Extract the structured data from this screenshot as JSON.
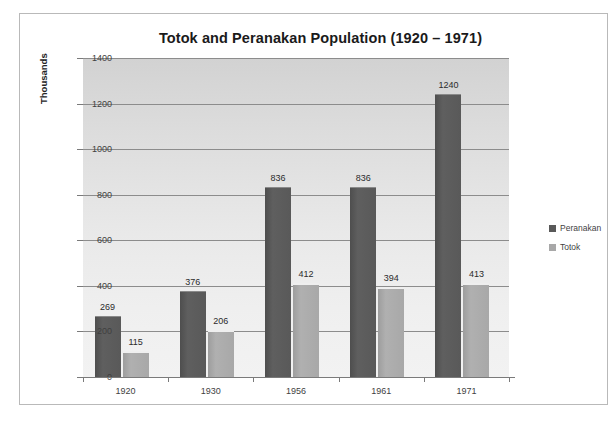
{
  "chart_data": {
    "type": "bar",
    "title": "Totok and Peranakan Population (1920 – 1971)",
    "xlabel": "",
    "ylabel": "Thousands",
    "ylim": [
      0,
      1400
    ],
    "ytick_step": 200,
    "yticks": [
      "0",
      "200",
      "400",
      "600",
      "800",
      "1000",
      "1200",
      "1400"
    ],
    "grid": true,
    "legend_position": "right",
    "categories": [
      "1920",
      "1930",
      "1956",
      "1961",
      "1971"
    ],
    "series": [
      {
        "name": "Peranakan",
        "color": "#595959",
        "values": [
          269,
          376,
          836,
          836,
          1240
        ]
      },
      {
        "name": "Totok",
        "color": "#a8a8a8",
        "values": [
          115,
          206,
          412,
          394,
          413
        ]
      }
    ]
  },
  "legend": {
    "items": [
      {
        "label": "Peranakan"
      },
      {
        "label": "Totok"
      }
    ]
  }
}
